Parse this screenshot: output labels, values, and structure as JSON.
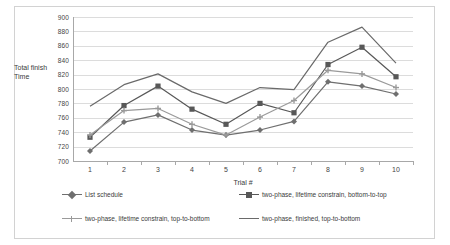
{
  "chart_data": {
    "type": "line",
    "title": "",
    "xlabel": "Trial #",
    "ylabel": "Total finish Time",
    "ylabel_lines": [
      "Total finish",
      "Time"
    ],
    "x": [
      1,
      2,
      3,
      4,
      5,
      6,
      7,
      8,
      9,
      10
    ],
    "categories": [
      "1",
      "2",
      "3",
      "4",
      "5",
      "6",
      "7",
      "8",
      "9",
      "10"
    ],
    "ylim": [
      700,
      900
    ],
    "yticks": [
      700,
      720,
      740,
      760,
      780,
      800,
      820,
      840,
      860,
      880,
      900
    ],
    "ytick_labels": [
      "700",
      "720",
      "740",
      "760",
      "780",
      "800",
      "820",
      "840",
      "860",
      "880",
      "900"
    ],
    "grid": true,
    "legend_position": "bottom",
    "series": [
      {
        "name": "List schedule",
        "marker": "diamond",
        "color": "#6f6f6f",
        "values": [
          714,
          754,
          764,
          743,
          736,
          743,
          755,
          810,
          804,
          793
        ]
      },
      {
        "name": "two-phase, lifetime constrain, bottom-to-top",
        "marker": "square",
        "color": "#585858",
        "values": [
          733,
          777,
          804,
          772,
          751,
          780,
          767,
          834,
          858,
          817
        ]
      },
      {
        "name": "two-phase, lifetime constrain, top-to-bottom",
        "marker": "cross",
        "color": "#9a9a9a",
        "values": [
          736,
          770,
          773,
          751,
          736,
          761,
          784,
          826,
          821,
          802
        ]
      },
      {
        "name": "two-phase, finished, top-to-bottom",
        "marker": "none",
        "color": "#6a6a6a",
        "values": [
          776,
          806,
          821,
          796,
          780,
          802,
          799,
          865,
          886,
          836
        ]
      }
    ]
  }
}
